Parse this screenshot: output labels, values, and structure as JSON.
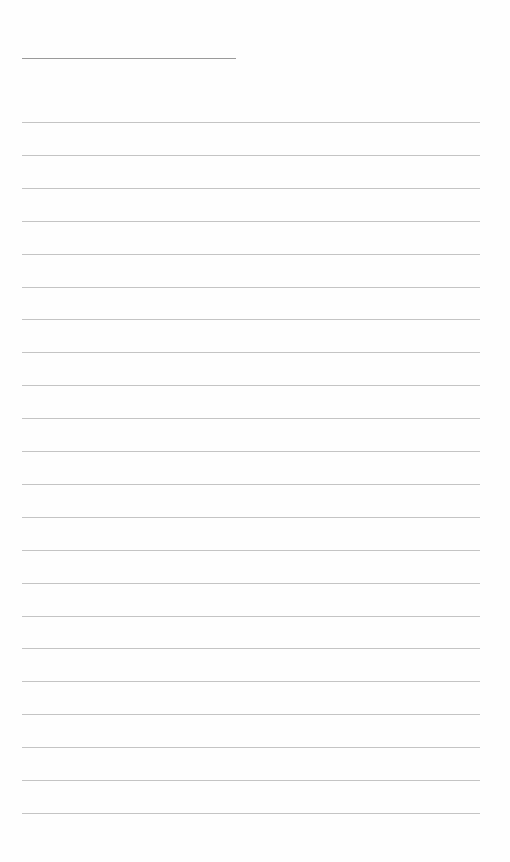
{
  "page": {
    "type": "lined-notebook-page",
    "title_line": {
      "present": true,
      "text": ""
    },
    "rules": {
      "count": 22,
      "first_y": 122,
      "spacing": 32.9,
      "color": "#c4c4c4",
      "lines": [
        "",
        "",
        "",
        "",
        "",
        "",
        "",
        "",
        "",
        "",
        "",
        "",
        "",
        "",
        "",
        "",
        "",
        "",
        "",
        "",
        "",
        ""
      ]
    }
  }
}
